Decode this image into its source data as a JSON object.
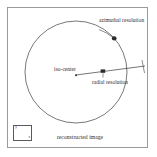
{
  "figure": {
    "caption": "reconstructed image",
    "background_color": "#ffffff",
    "frame_color": "#9a9a9a",
    "ink_color": "#2b2b2b"
  },
  "diagram": {
    "type": "schematic",
    "field_of_view": {
      "shape": "circle",
      "center_label": "iso-center",
      "center_x": 76,
      "center_y": 72,
      "radius": 51,
      "stroke_color": "#555555"
    },
    "annotations": [
      {
        "name": "azimuthal-resolution",
        "label": "azimuthal resolution",
        "marker": "dot",
        "marker_x": 114,
        "marker_y": 38,
        "leader_from_x": 104,
        "leader_from_y": 30
      },
      {
        "name": "radial-resolution",
        "label": "radial resolution",
        "marker": "square",
        "marker_x": 103,
        "marker_y": 72,
        "leader_from_x": 105,
        "leader_from_y": 78
      },
      {
        "name": "iso-center",
        "label": "iso-center",
        "marker": "dot",
        "marker_x": 76,
        "marker_y": 75
      }
    ],
    "radial_ray": {
      "from_x": 76,
      "from_y": 75,
      "to_x": 145,
      "to_y": 66,
      "has_tick": true
    }
  },
  "axis_indicator": {
    "name": "orientation-axes",
    "y_label": "y",
    "x_label": "x"
  }
}
